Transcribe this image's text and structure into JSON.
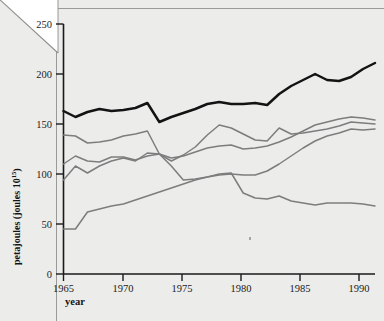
{
  "figure": {
    "background_color": "#ececeb",
    "total_line_color": "#131313",
    "sector_line_color": "#7d7d7d"
  },
  "axes": {
    "y_title_main": "petajoules (joules 10",
    "y_title_exponent": "15",
    "y_title_close": ")",
    "x_title": "year",
    "y_ticks": [
      "0",
      "50",
      "100",
      "150",
      "200",
      "250"
    ],
    "x_ticks": [
      "1965",
      "1970",
      "1975",
      "1980",
      "1985",
      "1990"
    ]
  },
  "chart_data": {
    "type": "line",
    "title": "",
    "xlabel": "year",
    "ylabel": "petajoules (joules 10^15)",
    "xlim": [
      1965,
      1991
    ],
    "ylim": [
      0,
      250
    ],
    "grid": false,
    "legend": "none",
    "x": [
      1965,
      1966,
      1967,
      1968,
      1969,
      1970,
      1971,
      1972,
      1973,
      1974,
      1975,
      1976,
      1977,
      1978,
      1979,
      1980,
      1981,
      1982,
      1983,
      1984,
      1985,
      1986,
      1987,
      1988,
      1989,
      1990,
      1991
    ],
    "series": [
      {
        "name": "total",
        "style": "thick-black",
        "color": "#131313",
        "values": [
          163,
          157,
          162,
          165,
          163,
          164,
          166,
          171,
          152,
          157,
          161,
          165,
          170,
          172,
          170,
          170,
          171,
          169,
          180,
          188,
          194,
          200,
          194,
          193,
          197,
          205,
          211
        ]
      },
      {
        "name": "sector-a",
        "style": "gray",
        "color": "#7d7d7d",
        "values": [
          139,
          138,
          131,
          132,
          134,
          138,
          140,
          143,
          120,
          113,
          119,
          127,
          139,
          149,
          146,
          140,
          134,
          133,
          146,
          140,
          141,
          143,
          145,
          148,
          152,
          151,
          150
        ]
      },
      {
        "name": "sector-b",
        "style": "gray",
        "color": "#7d7d7d",
        "values": [
          110,
          118,
          113,
          112,
          117,
          117,
          114,
          118,
          120,
          116,
          118,
          122,
          126,
          128,
          129,
          125,
          126,
          128,
          132,
          137,
          143,
          149,
          152,
          155,
          157,
          156,
          154
        ]
      },
      {
        "name": "sector-c",
        "style": "gray",
        "color": "#7d7d7d",
        "values": [
          94,
          108,
          101,
          108,
          113,
          116,
          113,
          121,
          120,
          108,
          94,
          95,
          97,
          100,
          101,
          81,
          76,
          75,
          78,
          73,
          71,
          69,
          71,
          71,
          71,
          70,
          68
        ]
      },
      {
        "name": "sector-d",
        "style": "gray",
        "color": "#7d7d7d",
        "values": [
          45,
          45,
          62,
          65,
          68,
          70,
          74,
          78,
          82,
          86,
          90,
          94,
          97,
          99,
          100,
          99,
          99,
          103,
          110,
          118,
          126,
          133,
          138,
          141,
          145,
          144,
          145
        ]
      }
    ]
  }
}
